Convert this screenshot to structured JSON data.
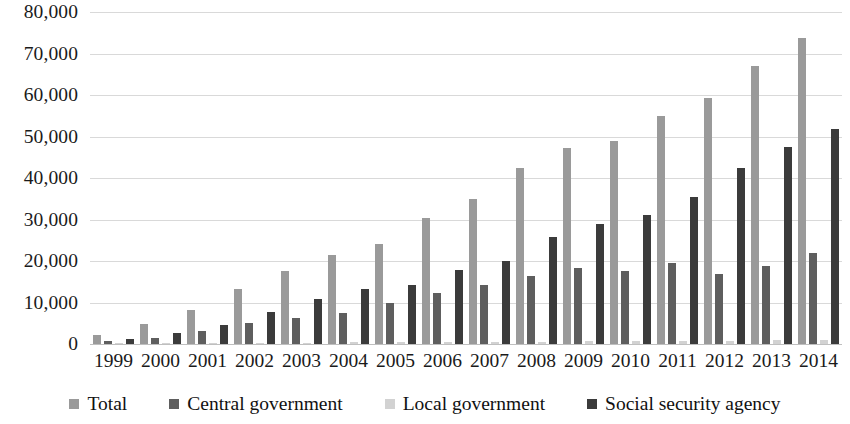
{
  "chart_data": {
    "type": "bar",
    "title": "",
    "subtitle": "",
    "xlabel": "",
    "ylabel": "",
    "ylim": [
      0,
      80000
    ],
    "ytick_step": 10000,
    "ytick_labels": [
      "0",
      "10,000",
      "20,000",
      "30,000",
      "40,000",
      "50,000",
      "60,000",
      "70,000",
      "80,000"
    ],
    "ytick_values": [
      0,
      10000,
      20000,
      30000,
      40000,
      50000,
      60000,
      70000,
      80000
    ],
    "grid": true,
    "grid_axis": "y",
    "legend_position": "bottom",
    "categories": [
      "1999",
      "2000",
      "2001",
      "2002",
      "2003",
      "2004",
      "2005",
      "2006",
      "2007",
      "2008",
      "2009",
      "2010",
      "2011",
      "2012",
      "2013",
      "2014"
    ],
    "series": [
      {
        "name": "Total",
        "color": "#9a9a9a",
        "values": [
          2200,
          4800,
          8200,
          13200,
          17500,
          21500,
          24200,
          30400,
          34900,
          42400,
          47300,
          48900,
          55000,
          59400,
          66900,
          73800
        ]
      },
      {
        "name": "Central government",
        "color": "#5e5e5e",
        "values": [
          700,
          1400,
          3200,
          5100,
          6300,
          7400,
          9800,
          12200,
          14300,
          16300,
          18400,
          17500,
          19500,
          16800,
          18900,
          22000
        ]
      },
      {
        "name": "Local government",
        "color": "#d2d2d2",
        "values": [
          100,
          150,
          200,
          300,
          350,
          400,
          450,
          500,
          550,
          600,
          650,
          700,
          750,
          800,
          850,
          900
        ]
      },
      {
        "name": "Social security agency",
        "color": "#3b3b3b",
        "values": [
          1200,
          2600,
          4500,
          7800,
          10900,
          13300,
          14200,
          17800,
          20000,
          25700,
          28800,
          31200,
          35400,
          42300,
          47500,
          51700
        ]
      }
    ]
  },
  "legend": {
    "items": [
      {
        "label": "Total",
        "color": "#9a9a9a"
      },
      {
        "label": "Central government",
        "color": "#5e5e5e"
      },
      {
        "label": "Local government",
        "color": "#d2d2d2"
      },
      {
        "label": "Social security agency",
        "color": "#3b3b3b"
      }
    ]
  },
  "colors": {
    "gridline": "#d9d9d9",
    "baseline": "#bfbfbf",
    "text": "#1a1a1a",
    "background": "#ffffff"
  }
}
